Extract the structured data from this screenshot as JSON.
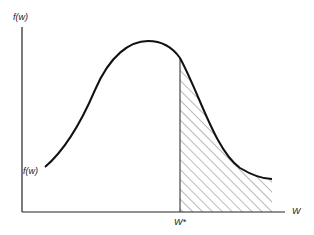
{
  "diagram": {
    "type": "probability-density-curve",
    "y_axis_label": "f(w)",
    "x_axis_label": "W",
    "threshold_label": "W*",
    "curve_label": "f(w)",
    "shaded_region": "area under f(w) to the right of W*",
    "colors": {
      "line": "#111111",
      "hatch": "#555555",
      "background": "#ffffff"
    }
  }
}
